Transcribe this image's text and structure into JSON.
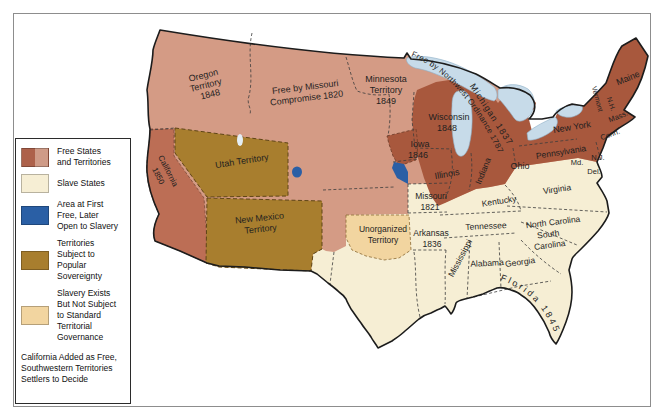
{
  "colors": {
    "free_state": "#a8583d",
    "free_state_california": "#bc6e55",
    "free_territory": "#d49b85",
    "slave_state": "#f6eed4",
    "area_first_free_later_slavery": "#2a5fa5",
    "popular_sovereignty_territory": "#a87e2e",
    "slavery_not_standard_governance": "#f2d5a0",
    "lake": "#c7dbe9",
    "outline": "#1c1c1c"
  },
  "legend": {
    "items": [
      {
        "key": "free-states-territories",
        "swatch": "split #ad614a / #cf9b87",
        "lines": [
          "Free States",
          "and Territories"
        ]
      },
      {
        "key": "slave-states",
        "swatch": "#f6eed4",
        "lines": [
          "Slave States"
        ]
      },
      {
        "key": "first-free-later-open",
        "swatch": "#2a5fa5",
        "lines": [
          "Area at First",
          "Free, Later",
          "Open to Slavery"
        ]
      },
      {
        "key": "popular-sovereignty",
        "swatch": "#a87e2e",
        "lines": [
          "Territories",
          "Subject to",
          "Popular",
          "Sovereignty"
        ]
      },
      {
        "key": "slavery-not-standard",
        "swatch": "#f2d5a0",
        "lines": [
          "Slavery Exists",
          "But Not Subject",
          "to Standard",
          "Territorial",
          "Governance"
        ]
      }
    ],
    "footnote": [
      "California Added as Free,",
      "Southwestern Territories",
      "Settlers to Decide"
    ]
  },
  "map": {
    "labels": {
      "oregon": [
        "Oregon",
        "Territory",
        "1848"
      ],
      "missouri_compromise": [
        "Free by Missouri",
        "Compromise 1820"
      ],
      "minnesota": [
        "Minnesota",
        "Territory",
        "1849"
      ],
      "northwest_ordinance": "Free by Northwest Ordinance 1787",
      "michigan": "Michigan 1837",
      "wisconsin": [
        "Wisconsin",
        "1848"
      ],
      "iowa": [
        "Iowa",
        "1846"
      ],
      "illinois": "Illinois",
      "indiana": "Indiana",
      "ohio": "Ohio",
      "pennsylvania": "Pennsylvania",
      "new_york": "New York",
      "maine": "Maine",
      "vermont": "Vermont",
      "new_hampshire": "N.H.",
      "massachusetts": "Mass.",
      "connecticut": "Conn.",
      "new_jersey": "N.J.",
      "maryland": "Md.",
      "delaware": "Del.",
      "virginia": "Virginia",
      "kentucky": "Kentucky",
      "tennessee": "Tennessee",
      "north_carolina": "North Carolina",
      "south_carolina": [
        "South",
        "Carolina"
      ],
      "georgia": "Georgia",
      "alabama": "Alabama",
      "mississippi": "Mississippi",
      "missouri": [
        "Missouri",
        "1821"
      ],
      "arkansas": [
        "Arkansas",
        "1836"
      ],
      "unorganized": [
        "Unorganized",
        "Territory"
      ],
      "florida": "Florida 1845",
      "utah": "Utah Territory",
      "new_mexico": [
        "New Mexico",
        "Territory"
      ],
      "california": [
        "California",
        "1850"
      ]
    }
  }
}
